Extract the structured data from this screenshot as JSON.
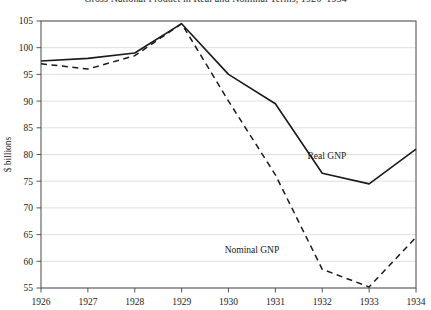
{
  "chart_data": {
    "type": "line",
    "title": "Gross National Product in Real and Nominal Terms, 1926–1934",
    "xlabel": "",
    "ylabel": "$ billions",
    "x": [
      1926,
      1927,
      1928,
      1929,
      1930,
      1931,
      1932,
      1933,
      1934
    ],
    "xtick_labels": [
      "1926",
      "1927",
      "1928",
      "1929",
      "1930",
      "1931",
      "1932",
      "1933",
      "1934"
    ],
    "xlim": [
      1926,
      1934
    ],
    "ylim": [
      55,
      105
    ],
    "ytick_labels": [
      "55",
      "60",
      "65",
      "70",
      "75",
      "80",
      "85",
      "90",
      "95",
      "100",
      "105"
    ],
    "yticks": [
      55,
      60,
      65,
      70,
      75,
      80,
      85,
      90,
      95,
      100,
      105
    ],
    "grid": true,
    "legend_position": "inline-annotation",
    "series": [
      {
        "name": "Real GNP",
        "style": "solid",
        "color": "#1a1a1a",
        "label_x": 1932.1,
        "label_y": 79.2,
        "values": [
          97.5,
          98.0,
          99.0,
          104.5,
          95.0,
          89.5,
          76.5,
          74.5,
          81.0
        ]
      },
      {
        "name": "Nominal GNP",
        "style": "dashed",
        "color": "#1a1a1a",
        "label_x": 1930.5,
        "label_y": 61.6,
        "values": [
          97.0,
          96.0,
          98.5,
          104.5,
          90.0,
          76.2,
          58.5,
          55.2,
          64.5
        ]
      }
    ]
  }
}
